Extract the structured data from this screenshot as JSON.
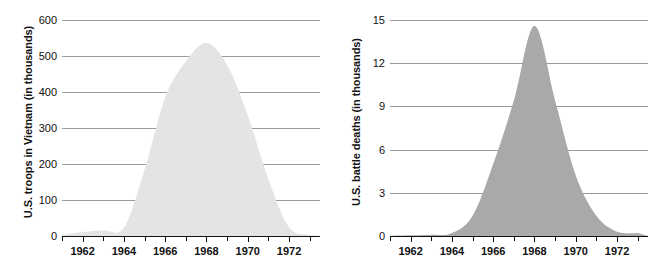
{
  "figure": {
    "background_color": "#ffffff",
    "panels": [
      {
        "name": "us-troops-in-vietnam",
        "ytitle": "U.S. troops in Vietnam (in thousands)",
        "fill_color": "#e4e4e4",
        "grid_color": "#9a9a9a",
        "axis_color": "#111111"
      },
      {
        "name": "us-battle-deaths",
        "ytitle": "U.S. battle deaths (in thousands)",
        "fill_color": "#a9a9a9",
        "grid_color": "#9a9a9a",
        "axis_color": "#111111"
      }
    ]
  },
  "chart_data": [
    {
      "type": "area",
      "name": "us-troops-in-vietnam",
      "title": "",
      "xlabel": "",
      "ylabel": "U.S. troops in Vietnam (in thousands)",
      "xlim": [
        1961,
        1973.5
      ],
      "ylim": [
        0,
        600
      ],
      "grid": true,
      "legend": "none",
      "ytick_labels": [
        "600",
        "500",
        "400",
        "300",
        "200",
        "100",
        "0"
      ],
      "ytick_values": [
        600,
        500,
        400,
        300,
        200,
        100,
        0
      ],
      "xtick_values": [
        1961,
        1962,
        1963,
        1964,
        1965,
        1966,
        1967,
        1968,
        1969,
        1970,
        1971,
        1972,
        1973
      ],
      "xtick_labels": [
        "",
        "1962",
        "",
        "1964",
        "",
        "1966",
        "",
        "1968",
        "",
        "1970",
        "",
        "1972",
        ""
      ],
      "x": [
        1961,
        1962,
        1963,
        1964,
        1965,
        1966,
        1967,
        1968,
        1969,
        1970,
        1971,
        1972,
        1973
      ],
      "values": [
        3,
        11,
        16,
        23,
        184,
        385,
        485,
        536,
        475,
        335,
        157,
        24,
        3
      ]
    },
    {
      "type": "area",
      "name": "us-battle-deaths",
      "title": "",
      "xlabel": "",
      "ylabel": "U.S. battle deaths (in thousands)",
      "xlim": [
        1961,
        1973.5
      ],
      "ylim": [
        0,
        15
      ],
      "grid": true,
      "legend": "none",
      "ytick_labels": [
        "15",
        "12",
        "9",
        "6",
        "3",
        "0"
      ],
      "ytick_values": [
        15,
        12,
        9,
        6,
        3,
        0
      ],
      "xtick_values": [
        1961,
        1962,
        1963,
        1964,
        1965,
        1966,
        1967,
        1968,
        1969,
        1970,
        1971,
        1972,
        1973
      ],
      "xtick_labels": [
        "",
        "1962",
        "",
        "1964",
        "",
        "1966",
        "",
        "1968",
        "",
        "1970",
        "",
        "1972",
        ""
      ],
      "x": [
        1961,
        1962,
        1963,
        1964,
        1965,
        1966,
        1967,
        1968,
        1969,
        1970,
        1971,
        1972,
        1973
      ],
      "values": [
        0.02,
        0.05,
        0.08,
        0.2,
        1.4,
        5.0,
        9.4,
        14.6,
        9.4,
        4.2,
        1.4,
        0.3,
        0.2
      ]
    }
  ]
}
